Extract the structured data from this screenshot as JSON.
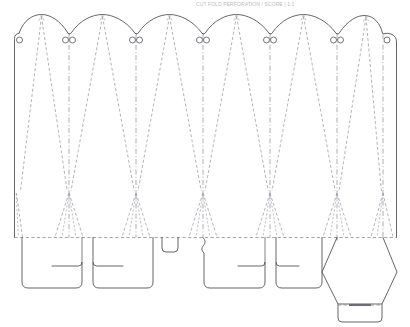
{
  "document": {
    "kind": "dieline-template",
    "title": "Carton cut-and-fold dieline",
    "header_text": "CUT  FOLD  PERFORATION / SCORE  |  1:1",
    "canvas": {
      "width": 410,
      "height": 327,
      "background": "#ffffff"
    }
  },
  "legend_colors": {
    "cut_line": "#4a4a52",
    "fold_line": "#8d8d96",
    "fold_dash_dot": "#9a9aa3",
    "hole": "#53535b",
    "score_mark": "#6d6d76",
    "background": "#ffffff"
  },
  "geometry": {
    "body": {
      "left": 14.5,
      "right": 396.5,
      "top_shoulder": 34.0,
      "bottom_fold": 237.5,
      "corner_radius": 4.5
    },
    "panels": {
      "count": 6,
      "division_x": [
        14.5,
        69.0,
        136.0,
        203.0,
        270.0,
        337.0,
        383.0,
        396.5
      ],
      "arch_apex_y": 14.5,
      "arch_apex_x": [
        41.5,
        102.5,
        169.5,
        236.5,
        303.5,
        366.0
      ]
    },
    "holes": {
      "radius": 3.0,
      "y": 40.0,
      "x": [
        19.5,
        65.5,
        72.5,
        132.5,
        139.5,
        199.5,
        206.5,
        266.5,
        273.5,
        333.5,
        340.5,
        387.0
      ]
    },
    "fold_fan_apex_y": 193.0,
    "glue_flap": {
      "x": 383.0,
      "width": 13.5
    },
    "hexagon": {
      "left": 322.0,
      "right": 397.0,
      "top": 238.0,
      "mid_y": 272.0,
      "bottom": 304.0,
      "tab": {
        "left": 338.0,
        "right": 382.0,
        "bottom": 322.0,
        "score_y": 305.0
      }
    },
    "bottom_tabs": [
      {
        "name": "tab-1",
        "left": 22.0,
        "right": 82.0,
        "bottom": 288.0,
        "notch_y": 266.0,
        "notch_x": 52.0
      },
      {
        "name": "tab-2",
        "left": 93.0,
        "right": 153.0,
        "bottom": 288.0,
        "notch_y": 266.0,
        "notch_x": 123.0
      },
      {
        "name": "tab-center-lock",
        "left": 162.0,
        "right": 178.0,
        "bottom": 252.0
      },
      {
        "name": "tab-3",
        "left": 210.0,
        "right": 265.0,
        "bottom": 288.0,
        "notch_y": 266.0,
        "notch_x": 238.0
      },
      {
        "name": "tab-4",
        "left": 276.0,
        "right": 322.0,
        "bottom": 288.0,
        "notch_y": 266.0,
        "notch_x": 299.0
      }
    ]
  }
}
